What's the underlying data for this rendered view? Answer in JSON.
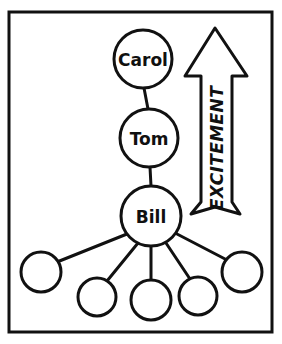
{
  "diagram": {
    "style": "hand-drawn sketch, black ink on white",
    "frame": {
      "name": "outer border rectangle",
      "x": 9,
      "y": 12,
      "width": 263,
      "height": 320,
      "stroke": "#111111",
      "stroke_width": 3,
      "fill": "#ffffff"
    },
    "colors": {
      "ink": "#111111",
      "paper": "#ffffff",
      "text": "#101010"
    },
    "named_nodes": [
      {
        "id": "carol",
        "label": "Carol",
        "cx": 143,
        "cy": 59,
        "r": 29,
        "font_size": 17
      },
      {
        "id": "tom",
        "label": "Tom",
        "cx": 149,
        "cy": 138,
        "r": 29,
        "font_size": 17
      },
      {
        "id": "bill",
        "label": "Bill",
        "cx": 151,
        "cy": 216,
        "r": 30,
        "font_size": 17
      }
    ],
    "child_nodes": [
      {
        "id": "child-1",
        "label": "",
        "cx": 41,
        "cy": 272,
        "r": 20
      },
      {
        "id": "child-2",
        "label": "",
        "cx": 97,
        "cy": 297,
        "r": 19
      },
      {
        "id": "child-3",
        "label": "",
        "cx": 151,
        "cy": 300,
        "r": 20
      },
      {
        "id": "child-4",
        "label": "",
        "cx": 198,
        "cy": 296,
        "r": 19
      },
      {
        "id": "child-5",
        "label": "",
        "cx": 242,
        "cy": 272,
        "r": 20
      }
    ],
    "spine_connectors": [
      {
        "id": "carol-to-tom",
        "x1": 144,
        "y1": 88,
        "x2": 148,
        "y2": 109
      },
      {
        "id": "tom-to-bill",
        "x1": 150,
        "y1": 167,
        "x2": 151,
        "y2": 186
      }
    ],
    "fan_connectors": [
      {
        "id": "bill-to-child-1",
        "x1": 127,
        "y1": 234,
        "x2": 57,
        "y2": 262
      },
      {
        "id": "bill-to-child-2",
        "x1": 138,
        "y1": 243,
        "x2": 107,
        "y2": 281
      },
      {
        "id": "bill-to-child-3",
        "x1": 151,
        "y1": 246,
        "x2": 151,
        "y2": 280
      },
      {
        "id": "bill-to-child-4",
        "x1": 166,
        "y1": 243,
        "x2": 190,
        "y2": 279
      },
      {
        "id": "bill-to-child-5",
        "x1": 177,
        "y1": 234,
        "x2": 227,
        "y2": 260
      }
    ],
    "arrow": {
      "id": "excitement-arrow",
      "label": "EXCITEMENT",
      "direction": "up",
      "font_size": 17,
      "text_cx": 217,
      "text_cy": 148,
      "text_rotation": -90,
      "outline_points": "215,28 247,76 232,76 232,202 240,214 215,207 191,214 201,202 201,76 185,76",
      "stroke": "#111111",
      "stroke_width": 3,
      "fill": "#ffffff"
    }
  }
}
